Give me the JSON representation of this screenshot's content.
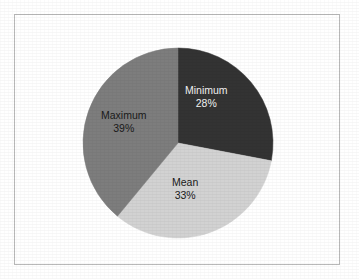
{
  "chart_data": {
    "type": "pie",
    "title": "",
    "subtitle": "",
    "xlabel": "",
    "ylabel": "",
    "legend_position": "none",
    "grid": false,
    "labels_inside_slices": true,
    "start_angle_deg": 0,
    "direction": "clockwise",
    "categories": [
      "Minimum",
      "Mean",
      "Maximum"
    ],
    "values": [
      28,
      33,
      39
    ],
    "value_unit": "%",
    "slices": [
      {
        "label": "Minimum",
        "value": 28,
        "value_text": "28%",
        "color": "#333333",
        "text_color": "#f2f2f2",
        "start_angle_deg": 0,
        "end_angle_deg": 100.8
      },
      {
        "label": "Mean",
        "value": 33,
        "value_text": "33%",
        "color": "#d2d2d2",
        "text_color": "#1a1a1a",
        "start_angle_deg": 100.8,
        "end_angle_deg": 219.6
      },
      {
        "label": "Maximum",
        "value": 39,
        "value_text": "39%",
        "color": "#7d7d7d",
        "text_color": "#1a1a1a",
        "start_angle_deg": 219.6,
        "end_angle_deg": 360
      }
    ]
  },
  "figure": {
    "background_color": "#ffffff",
    "frame_color": "#b9b9b9",
    "pie_center_x": 178,
    "pie_center_y": 143,
    "pie_radius": 95
  },
  "labels": {
    "minimum": {
      "name": "Minimum",
      "value": "28%"
    },
    "mean": {
      "name": "Mean",
      "value": "33%"
    },
    "maximum": {
      "name": "Maximum",
      "value": "39%"
    }
  }
}
